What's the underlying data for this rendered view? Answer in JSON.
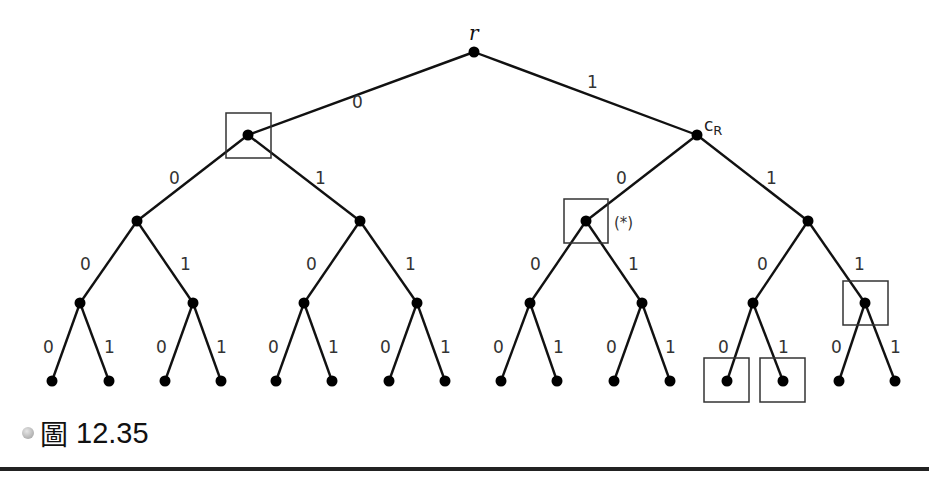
{
  "figure": {
    "caption_mark": "圖",
    "caption_number": "12.35",
    "root_label": "r",
    "cr_label": "c",
    "cr_subscript": "R",
    "star_label": "(*)",
    "edge_left_label": "0",
    "edge_right_label": "1"
  },
  "tree": {
    "type": "complete binary tree",
    "depth": 4,
    "leaf_count": 16,
    "boxed_nodes": [
      "0",
      "10",
      "111",
      "1100",
      "1101"
    ],
    "starred_node": "10"
  }
}
